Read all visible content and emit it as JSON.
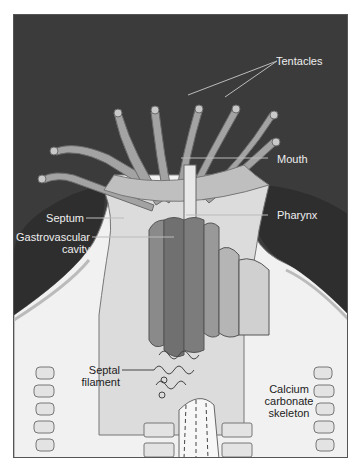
{
  "diagram": {
    "labels": {
      "tentacles": "Tentacles",
      "mouth": "Mouth",
      "pharynx": "Pharynx",
      "septum": "Septum",
      "gastrovascular_line1": "Gastrovascular",
      "gastrovascular_line2": "cavity",
      "septal_line1": "Septal",
      "septal_line2": "filament",
      "calcium_line1": "Calcium",
      "calcium_line2": "carbonate",
      "calcium_line3": "skeleton"
    },
    "colors": {
      "background": "#3a3a3a",
      "tissue": "#e6e6e6",
      "tentacle": "#9a9a9a",
      "skeleton": "#f0f0f0",
      "leader_line": "#bbbbbb"
    }
  }
}
